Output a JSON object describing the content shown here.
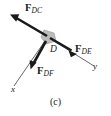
{
  "figure": {
    "caption": "(c)",
    "type": "free-body-diagram",
    "node_label": "D",
    "background_color": "#ffffff",
    "ink_color": "#1a1a1a",
    "gusset_color": "#b9b9b9",
    "axes": [
      {
        "name": "x-axis",
        "label": "x",
        "direction": "down-left"
      },
      {
        "name": "y-axis",
        "label": "y",
        "direction": "down-right"
      }
    ],
    "forces": [
      {
        "name": "F_DC",
        "symbol": "F",
        "subscript": "DC",
        "direction": "up-left",
        "tail": [
          48,
          37
        ],
        "tip": [
          11,
          15
        ]
      },
      {
        "name": "F_DE",
        "symbol": "F",
        "subscript": "DE",
        "direction": "down-right",
        "tail": [
          48,
          37
        ],
        "tip": [
          77,
          54
        ]
      },
      {
        "name": "F_DF",
        "symbol": "F",
        "subscript": "DF",
        "direction": "down-left",
        "tail": [
          48,
          37
        ],
        "tip": [
          31,
          69
        ]
      }
    ]
  }
}
